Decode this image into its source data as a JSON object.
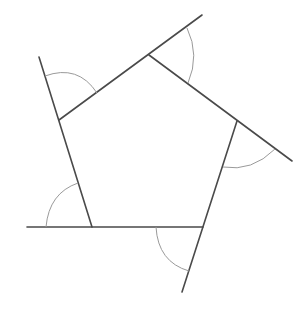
{
  "diagram": {
    "width": 307,
    "height": 314,
    "colors": {
      "background": "#ffffff",
      "line": "#4a4a4a",
      "arc": "#9a9a9a"
    },
    "vertices": [
      {
        "id": "A",
        "x": 59,
        "y": 120
      },
      {
        "id": "B",
        "x": 149,
        "y": 55
      },
      {
        "id": "C",
        "x": 237,
        "y": 121
      },
      {
        "id": "D",
        "x": 203,
        "y": 227
      },
      {
        "id": "E",
        "x": 92,
        "y": 227
      }
    ],
    "extended_sides": [
      {
        "name": "side-EA-extended",
        "x1": 92,
        "y1": 227,
        "x2": 39,
        "y2": 57
      },
      {
        "name": "side-AB-extended",
        "x1": 59,
        "y1": 120,
        "x2": 202,
        "y2": 15
      },
      {
        "name": "side-BC-extended",
        "x1": 149,
        "y1": 55,
        "x2": 292,
        "y2": 161
      },
      {
        "name": "side-CD-extended",
        "x1": 237,
        "y1": 121,
        "x2": 182,
        "y2": 292
      },
      {
        "name": "side-DE-extended",
        "x1": 203,
        "y1": 227,
        "x2": 27,
        "y2": 227
      }
    ],
    "exterior_angle_arcs": [
      {
        "name": "exterior-angle-arc-A",
        "d": "M 45 76 Q 78 64 97 93"
      },
      {
        "name": "exterior-angle-arc-B",
        "d": "M 187 28 Q 200 55 188 83"
      },
      {
        "name": "exterior-angle-arc-C",
        "d": "M 275 149 Q 252 172 223 167"
      },
      {
        "name": "exterior-angle-arc-D",
        "d": "M 156 227 Q 158 262 189 271"
      },
      {
        "name": "exterior-angle-arc-E",
        "d": "M 46 227 Q 49 193 78 183"
      }
    ]
  }
}
